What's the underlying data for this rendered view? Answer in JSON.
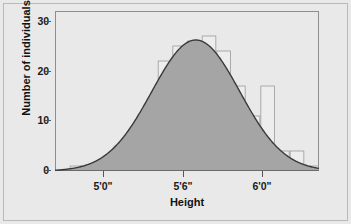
{
  "chart_data": {
    "type": "bar",
    "title": "",
    "subtitle": "",
    "xlabel": "Height",
    "ylabel": "Number of individuals",
    "ylim": [
      0,
      32
    ],
    "yticks": [
      0,
      10,
      20,
      30
    ],
    "ytick_labels": [
      "0",
      "10",
      "20",
      "30"
    ],
    "xlim_inches": [
      57.0,
      75.0
    ],
    "xticks_inches": [
      60,
      66,
      72
    ],
    "xtick_labels": [
      "5'0\"",
      "5'6\"",
      "6'0\""
    ],
    "grid": false,
    "legend": null,
    "bin_width_inches": 1,
    "bin_starts_inches": [
      58,
      59,
      60,
      61,
      62,
      63,
      64,
      65,
      66,
      67,
      68,
      69,
      70,
      71,
      72,
      73,
      74
    ],
    "categories": [
      "58\"",
      "59\"",
      "60\"",
      "61\"",
      "62\"",
      "63\"",
      "64\"",
      "65\"",
      "66\"",
      "67\"",
      "68\"",
      "69\"",
      "70\"",
      "71\"",
      "72\"",
      "73\"",
      "74\""
    ],
    "values": [
      1,
      0,
      1,
      5,
      7,
      7,
      22,
      25,
      26,
      27,
      24,
      17,
      11,
      17,
      4,
      4,
      1
    ],
    "series": [
      {
        "name": "Number of individuals",
        "values": [
          1,
          0,
          1,
          5,
          7,
          7,
          22,
          25,
          26,
          27,
          24,
          17,
          11,
          17,
          4,
          4,
          1
        ]
      }
    ],
    "overlay_curve": {
      "type": "normal",
      "name": "normal distribution curve",
      "mean_inches": 66.6,
      "sd_inches": 3.0,
      "peak_value": 26.2,
      "shaded": true,
      "shade_color": "#a5a5a5",
      "line_color": "#3a3a3a"
    },
    "colors": {
      "bar_fill": "#ededed",
      "bar_edge": "#9a9a9a",
      "panel_background": "#e9e9e9",
      "frame": "#8e8e8e",
      "axis_text": "#1b1b1b",
      "curve_line": "#3a3a3a",
      "curve_shade": "#a5a5a5",
      "figure_background": "#e9e9e9",
      "outer_border": "#b9b9b9"
    }
  },
  "axes": {
    "y": {
      "title": "Number of individuals",
      "ticks": [
        {
          "label": "30",
          "value": 30
        },
        {
          "label": "20",
          "value": 20
        },
        {
          "label": "10",
          "value": 10
        },
        {
          "label": "0",
          "value": 0
        }
      ]
    },
    "x": {
      "title": "Height",
      "ticks": [
        {
          "label": "5'0\"",
          "value": 60
        },
        {
          "label": "5'6\"",
          "value": 66
        },
        {
          "label": "6'0\"",
          "value": 72
        }
      ]
    }
  }
}
